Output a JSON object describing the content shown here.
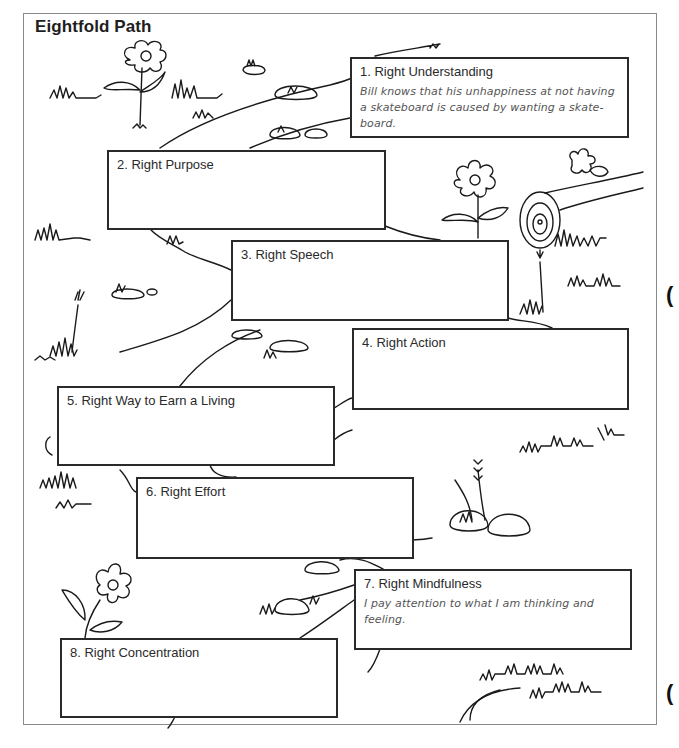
{
  "page": {
    "title": "Eightfold Path"
  },
  "steps": [
    {
      "label": "1. Right Understanding",
      "text": "Bill knows that his unhappiness at not having a skateboard is caused by wanting a skate-board."
    },
    {
      "label": "2. Right Purpose",
      "text": ""
    },
    {
      "label": "3. Right Speech",
      "text": ""
    },
    {
      "label": "4. Right Action",
      "text": ""
    },
    {
      "label": "5. Right Way to Earn a Living",
      "text": ""
    },
    {
      "label": "6. Right Effort",
      "text": ""
    },
    {
      "label": "7. Right Mindfulness",
      "text": "I pay attention to what I am thinking and feeling."
    },
    {
      "label": "8. Right Concentration",
      "text": ""
    }
  ],
  "illustration": {
    "elements": [
      "flower",
      "grass-tufts",
      "rocks",
      "winding-path",
      "log",
      "dandelion"
    ]
  },
  "colors": {
    "frame": "#8a8a8a",
    "box_border": "#2a2a2a",
    "line_art": "#1a1a1a",
    "example_text": "#555555"
  }
}
